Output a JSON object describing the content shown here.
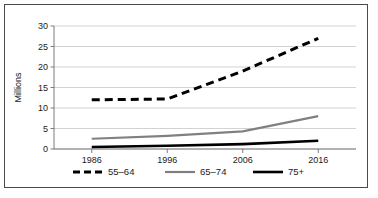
{
  "chart_data": {
    "type": "line",
    "title": "",
    "xlabel": "",
    "ylabel": "Millions",
    "categories": [
      "1986",
      "1996",
      "2006",
      "2016"
    ],
    "x": [
      1986,
      1996,
      2006,
      2016
    ],
    "ylim": [
      0,
      30
    ],
    "y_ticks": [
      "0",
      "5",
      "10",
      "15",
      "20",
      "25",
      "30"
    ],
    "y_tick_values": [
      0,
      5,
      10,
      15,
      20,
      25,
      30
    ],
    "grid": "horizontal",
    "legend_position": "bottom",
    "series": [
      {
        "name": "55–64",
        "values": [
          12,
          12.2,
          19,
          27
        ],
        "color": "#000000",
        "style": "dashed",
        "width": 3
      },
      {
        "name": "65–74",
        "values": [
          2.5,
          3.2,
          4.3,
          8
        ],
        "color": "#808080",
        "style": "solid",
        "width": 2.2
      },
      {
        "name": "75+",
        "values": [
          0.5,
          0.8,
          1.2,
          2
        ],
        "color": "#000000",
        "style": "solid",
        "width": 2.6
      }
    ]
  },
  "legend": {
    "items": [
      {
        "label": "55–64"
      },
      {
        "label": "65–74"
      },
      {
        "label": "75+"
      }
    ]
  },
  "axes": {
    "y_title": "Millions"
  }
}
